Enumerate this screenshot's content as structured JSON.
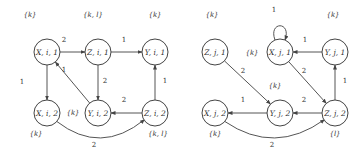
{
  "graphs": [
    {
      "id": "i",
      "nodes": [
        {
          "id": "Xi1",
          "label": "X, i, 1",
          "x": 47,
          "y": 52,
          "set": "{k}",
          "set_x": 30,
          "set_y": 17
        },
        {
          "id": "Zi1",
          "label": "Z, i, 1",
          "x": 98,
          "y": 52,
          "set": "{k, l}",
          "set_x": 93,
          "set_y": 17
        },
        {
          "id": "Yi1",
          "label": "Y, i, 1",
          "x": 155,
          "y": 52,
          "set": "{k}",
          "set_x": 155,
          "set_y": 17
        },
        {
          "id": "Xi2",
          "label": "X, i, 2",
          "x": 47,
          "y": 113,
          "set": "{k}",
          "set_x": 36,
          "set_y": 136
        },
        {
          "id": "Yi2",
          "label": "Y, i, 2",
          "x": 98,
          "y": 113,
          "set": "{k}",
          "set_x": 73,
          "set_y": 115
        },
        {
          "id": "Zi2",
          "label": "Z, i, 2",
          "x": 155,
          "y": 113,
          "set": "{k, l}",
          "set_x": 158,
          "set_y": 136
        }
      ],
      "edges": [
        {
          "from": "Xi1",
          "to": "Zi1",
          "weight": "2",
          "lx": 64,
          "ly": 42
        },
        {
          "from": "Zi1",
          "to": "Yi1",
          "weight": "1",
          "lx": 124,
          "ly": 42
        },
        {
          "from": "Xi1",
          "to": "Xi2",
          "weight": "1",
          "lx": 22,
          "ly": 84
        },
        {
          "from": "Zi1",
          "to": "Yi2",
          "weight": "2",
          "lx": 105,
          "ly": 83
        },
        {
          "from": "Yi2",
          "to": "Xi1",
          "weight": "1",
          "lx": 64,
          "ly": 72
        },
        {
          "from": "Zi2",
          "to": "Yi1",
          "weight": "1",
          "lx": 165,
          "ly": 83
        },
        {
          "from": "Zi2",
          "to": "Yi2",
          "weight": "2",
          "lx": 124,
          "ly": 102
        },
        {
          "from": "Xi2",
          "to": "Zi2",
          "weight": "2",
          "lx": 94,
          "ly": 147,
          "curve": true
        }
      ]
    },
    {
      "id": "j",
      "nodes": [
        {
          "id": "Zj1",
          "label": "Z, j, 1",
          "x": 215,
          "y": 52,
          "set": "{k}",
          "set_x": 212,
          "set_y": 17
        },
        {
          "id": "Xj1",
          "label": "X, j, 1",
          "x": 280,
          "y": 52,
          "set": "{k}",
          "set_x": 252,
          "set_y": 55
        },
        {
          "id": "Yj1",
          "label": "Y, j, 1",
          "x": 335,
          "y": 52,
          "set": "{k}",
          "set_x": 333,
          "set_y": 17
        },
        {
          "id": "Xj2",
          "label": "X, j, 2",
          "x": 215,
          "y": 113,
          "set": "{k}",
          "set_x": 215,
          "set_y": 136
        },
        {
          "id": "Yj2",
          "label": "Y, j, 2",
          "x": 280,
          "y": 113,
          "set": "{k}",
          "set_x": 275,
          "set_y": 88
        },
        {
          "id": "Zj2",
          "label": "Z, j, 2",
          "x": 335,
          "y": 113,
          "set": "{l}",
          "set_x": 335,
          "set_y": 136
        }
      ],
      "edges": [
        {
          "from": "Yj1",
          "to": "Xj1",
          "weight": "1",
          "lx": 305,
          "ly": 42
        },
        {
          "from": "Zj1",
          "to": "Yj2",
          "weight": "2",
          "lx": 243,
          "ly": 73
        },
        {
          "from": "Xj1",
          "to": "Zj2",
          "weight": "2",
          "lx": 304,
          "ly": 73
        },
        {
          "from": "Zj2",
          "to": "Yj1",
          "weight": "1",
          "lx": 345,
          "ly": 83
        },
        {
          "from": "Zj2",
          "to": "Yj2",
          "weight": "2",
          "lx": 304,
          "ly": 102
        },
        {
          "from": "Yj2",
          "to": "Xj2",
          "weight": "1",
          "lx": 243,
          "ly": 102
        },
        {
          "from": "Xj2",
          "to": "Zj2",
          "weight": "2",
          "lx": 272,
          "ly": 147,
          "curve": true
        },
        {
          "from": "Xj1",
          "to": "Xj1",
          "weight": "1",
          "lx": 274,
          "ly": 12,
          "self": true
        }
      ]
    }
  ]
}
